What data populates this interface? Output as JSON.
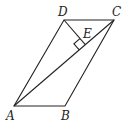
{
  "figure": {
    "type": "geometry-parallelogram",
    "labels": {
      "A": "A",
      "B": "B",
      "C": "C",
      "D": "D",
      "E": "E"
    },
    "points": {
      "A": [
        14,
        106
      ],
      "B": [
        65,
        106
      ],
      "C": [
        114,
        20
      ],
      "D": [
        64,
        20
      ],
      "E": [
        85.3,
        44.7
      ]
    },
    "segments": [
      "AB",
      "BC",
      "CD",
      "DA",
      "AC",
      "DE"
    ],
    "right_angle_at": "E",
    "stroke_color": "#222222",
    "background": "#ffffff"
  }
}
